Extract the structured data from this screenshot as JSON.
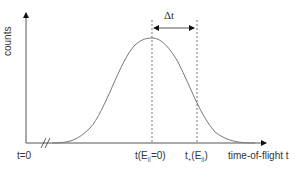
{
  "diagram": {
    "y_axis_label": "counts",
    "x_axis_label": "time-of-flight t",
    "origin_label": "t=0",
    "marker1": {
      "prefix": "t(E",
      "sub": "||",
      "suffix": "=0)"
    },
    "marker2": {
      "prefix": "t",
      "sub1": "+",
      "mid": "(E",
      "sub": "||",
      "suffix": ")"
    },
    "delta_label": "Δt",
    "axis_break": "//",
    "colors": {
      "axis": "#111111",
      "curve": "#777777",
      "dashed": "#555555",
      "text": "#333333"
    }
  }
}
